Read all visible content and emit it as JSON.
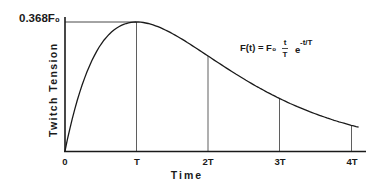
{
  "chart_data": {
    "type": "line",
    "title": "",
    "xlabel": "Time",
    "ylabel": "Twitch Tension",
    "x_tick_labels": [
      "0",
      "T",
      "2T",
      "3T",
      "4T"
    ],
    "y_tick_labels": [
      "0.368F₀"
    ],
    "equation": {
      "lhs": "F(t) = F₀",
      "frac_num": "t",
      "frac_den": "T",
      "exp_base": "e",
      "exp_power": "-t/T"
    },
    "series": [
      {
        "name": "F(t)",
        "x": [
          0,
          0.25,
          0.5,
          0.75,
          1,
          1.5,
          2,
          2.5,
          3,
          3.5,
          4,
          4.1
        ],
        "values_normalized": [
          0,
          0.584,
          0.824,
          0.963,
          1.0,
          0.91,
          0.736,
          0.558,
          0.406,
          0.287,
          0.199,
          0.186
        ]
      }
    ],
    "peak": {
      "x": "T",
      "y": "0.368F₀"
    },
    "vertical_markers": [
      "T",
      "2T",
      "3T",
      "4T"
    ],
    "grid": false
  }
}
